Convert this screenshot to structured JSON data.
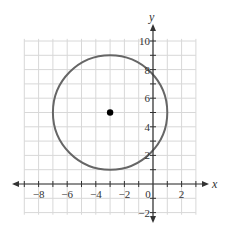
{
  "chart_data": {
    "type": "scatter",
    "title": "",
    "xlabel": "x",
    "ylabel": "y",
    "xlim": [
      -9,
      3
    ],
    "ylim": [
      -2,
      10
    ],
    "grid": true,
    "x_ticks": [
      -8,
      -6,
      -4,
      -2,
      0,
      2
    ],
    "x_tick_labels": [
      "−8",
      "−6",
      "−4",
      "−2",
      "0",
      "2"
    ],
    "y_ticks": [
      -2,
      2,
      4,
      6,
      8,
      10
    ],
    "y_tick_labels": [
      "−2",
      "2",
      "4",
      "6",
      "8",
      "10"
    ],
    "circle": {
      "center": [
        -3,
        5
      ],
      "radius": 4
    },
    "points": [
      {
        "x": -3,
        "y": 5,
        "label": "center"
      }
    ],
    "colors": {
      "circle": "#666666",
      "grid": "#d8d8d8",
      "axis": "#333333",
      "point": "#000000"
    }
  }
}
